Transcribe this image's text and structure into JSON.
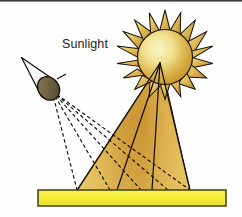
{
  "figure": {
    "labels": {
      "sunlight": "Sunlight"
    },
    "colors": {
      "background": "#fefefe",
      "top_rule": "#3a3a3a",
      "outline": "#1a1008",
      "sun_ray_light": "#f3e27f",
      "sun_ray_dark": "#b8872c",
      "sun_disc_center": "#f7f0b4",
      "sun_disc_edge": "#c89a2e",
      "beam_light": "#e3c05c",
      "beam_mid": "#cf9a3a",
      "beam_edge": "#d9b252",
      "ground_fill": "#f5ee3d",
      "ground_border": "#4e4a16",
      "cone_fill_light": "#ffffff",
      "cone_fill_shade": "#d8dde3",
      "aperture_fill": "#6f6243",
      "aperture_border": "#1a1008",
      "ray_solid": "#1a1008",
      "ray_dashed": "#1a1008",
      "label_text": "#231f1c"
    },
    "geometry": {
      "canvas_width": 242,
      "canvas_height": 217,
      "sun_center_x": 165,
      "sun_center_y": 57,
      "sun_disc_radius": 27,
      "sun_spike_count": 18,
      "sun_spike_outer_radius": 47,
      "ray_origin_x": 160,
      "ray_origin_y": 63,
      "beam_left_ground_x": 77,
      "beam_right_ground_x": 190,
      "ground_y_top": 190,
      "ground_y_bottom": 206,
      "ground_x_left": 38,
      "ground_x_right": 226,
      "eye_apex_x": 22,
      "eye_apex_y": 59,
      "eye_aperture_x": 49,
      "eye_aperture_y": 88,
      "solid_ray_ground_points": [
        77,
        117,
        152,
        190
      ],
      "dashed_ray_ground_points": [
        77,
        110,
        140,
        168,
        190
      ]
    },
    "elements": {
      "sun_name": "sun",
      "sun_disc_name": "sun-disc",
      "sun_rays_name": "sun-spikes",
      "beam_name": "light-beam",
      "ground_name": "ground-surface",
      "eye_name": "observer-viewing-cone",
      "aperture_name": "eye-aperture",
      "solid_rays_name": "incident-light-rays",
      "dashed_rays_name": "reflected-view-rays"
    }
  }
}
